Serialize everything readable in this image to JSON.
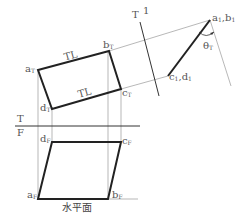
{
  "diagram": {
    "type": "descriptive-geometry-auxiliary-view",
    "caption": "水平面",
    "colors": {
      "object_line": "#222222",
      "projection_line": "#999999",
      "fold_line": "#333333",
      "label": "#555555"
    },
    "fold_lines": {
      "tf": {
        "top_label": "T",
        "bottom_label": "F"
      },
      "t1": {
        "left_label": "T",
        "right_label": "1"
      }
    },
    "top_view": {
      "a": {
        "main": "a",
        "sub": "T"
      },
      "b": {
        "main": "b",
        "sub": "T"
      },
      "c": {
        "main": "c",
        "sub": "T"
      },
      "d": {
        "main": "d",
        "sub": "T"
      },
      "edge_labels": [
        "TL",
        "TL"
      ]
    },
    "front_view": {
      "a": {
        "main": "a",
        "sub": "F"
      },
      "b": {
        "main": "b",
        "sub": "F"
      },
      "c": {
        "main": "c",
        "sub": "F"
      },
      "d": {
        "main": "d",
        "sub": "F"
      }
    },
    "auxiliary_view": {
      "ab": {
        "main": "a",
        "sub1": "1",
        "sep": ",",
        "main2": "b",
        "sub2": "1"
      },
      "cd": {
        "main": "c",
        "sub1": "1",
        "sep": ",",
        "main2": "d",
        "sub2": "1"
      },
      "angle": {
        "main": "θ",
        "sub": "T"
      }
    }
  }
}
